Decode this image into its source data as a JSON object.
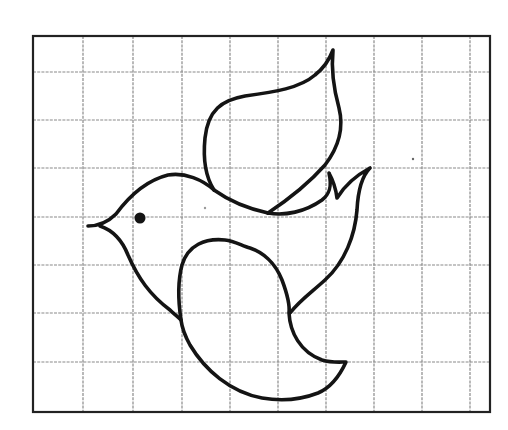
{
  "figure": {
    "description": "Outline drawing of a flying bird (dove) on a square grid for copying/drawing practice",
    "grid": {
      "columns": 9,
      "rows": 8,
      "frame": {
        "left": 33,
        "top": 36,
        "right": 490,
        "bottom": 412
      },
      "vertical_lines_x": [
        83,
        133,
        182,
        230,
        278,
        326,
        374,
        422,
        470
      ],
      "horizontal_lines_y": [
        72,
        120,
        168,
        217,
        265,
        313,
        362
      ],
      "line_color": "#8a8a8a",
      "frame_color": "#222222"
    },
    "drawing": {
      "subject": "bird",
      "parts": [
        "head-body",
        "eye",
        "beak",
        "upper-wing",
        "tail",
        "lower-wing"
      ],
      "stroke_color": "#141414",
      "eye_color": "#141414"
    }
  }
}
